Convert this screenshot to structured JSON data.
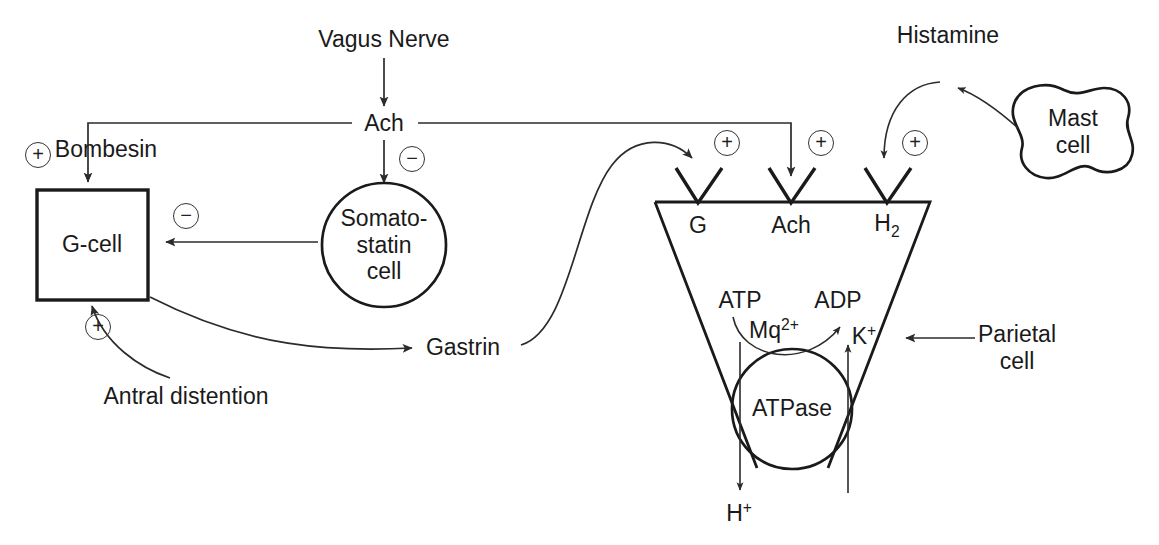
{
  "diagram": {
    "stroke_color": "#2b2b2b",
    "text_color": "#1a1a1a",
    "background": "#ffffff"
  },
  "nodes": {
    "vagus_nerve": {
      "label": "Vagus Nerve",
      "x": 384,
      "y": 40
    },
    "ach_source": {
      "label": "Ach",
      "x": 384,
      "y": 124
    },
    "bombesin": {
      "label": "Bombesin",
      "x": 106,
      "y": 150
    },
    "g_cell": {
      "label": "G-cell",
      "x": 92,
      "y": 245
    },
    "somatostatin_cell": {
      "label": "Somato-\nstatin\ncell",
      "line1": "Somato-",
      "line2": "statin",
      "line3": "cell",
      "x": 384,
      "y": 245
    },
    "antral_distention": {
      "label": "Antral distention",
      "x": 186,
      "y": 397
    },
    "gastrin": {
      "label": "Gastrin",
      "x": 463,
      "y": 348
    },
    "histamine": {
      "label": "Histamine",
      "x": 948,
      "y": 36
    },
    "mast_cell": {
      "line1": "Mast",
      "line2": "cell",
      "x": 1073,
      "y": 132
    },
    "parietal_cell": {
      "line1": "Parietal",
      "line2": "cell",
      "x": 1017,
      "y": 348
    },
    "atpase": {
      "label": "ATPase",
      "x": 792,
      "y": 409
    }
  },
  "receptors": [
    {
      "name": "gastrin-receptor",
      "label": "G",
      "x": 698,
      "y": 226
    },
    {
      "name": "ach-receptor",
      "label": "Ach",
      "x": 791,
      "y": 226
    },
    {
      "name": "histamine-receptor",
      "label": "H",
      "sub": "2",
      "x": 887,
      "y": 226
    }
  ],
  "signs": [
    {
      "name": "plus-bombesin",
      "symbol": "+",
      "x": 38,
      "y": 155
    },
    {
      "name": "minus-somatostatin",
      "symbol": "−",
      "x": 186,
      "y": 216
    },
    {
      "name": "minus-ach-somatostatin",
      "symbol": "−",
      "x": 412,
      "y": 159
    },
    {
      "name": "plus-antral-distention",
      "symbol": "+",
      "x": 98,
      "y": 327
    },
    {
      "name": "plus-gastrin-receptor",
      "symbol": "+",
      "x": 727,
      "y": 143
    },
    {
      "name": "plus-ach-receptor",
      "symbol": "+",
      "x": 821,
      "y": 143
    },
    {
      "name": "plus-histamine-receptor",
      "symbol": "+",
      "x": 915,
      "y": 143
    }
  ],
  "pump_labels": {
    "atp": {
      "label": "ATP",
      "x": 740,
      "y": 301
    },
    "adp": {
      "label": "ADP",
      "x": 838,
      "y": 301
    },
    "magnesium": {
      "label": "Mq",
      "sup": "2+",
      "x": 774,
      "y": 330
    },
    "potassium": {
      "label": "K",
      "sup": "+",
      "x": 864,
      "y": 336
    },
    "proton": {
      "label": "H",
      "sup": "+",
      "x": 739,
      "y": 513
    }
  },
  "connections": [
    {
      "name": "vagus-to-ach",
      "from": "vagus_nerve",
      "to": "ach_source",
      "type": "arrow"
    },
    {
      "name": "ach-to-bombesin-gcell",
      "from": "ach_source",
      "to": "g_cell",
      "type": "arrow"
    },
    {
      "name": "ach-to-ach-receptor",
      "from": "ach_source",
      "to": "ach-receptor",
      "type": "arrow"
    },
    {
      "name": "ach-to-somatostatin",
      "from": "ach_source",
      "to": "somatostatin_cell",
      "type": "inhibit"
    },
    {
      "name": "somatostatin-to-gcell",
      "from": "somatostatin_cell",
      "to": "g_cell",
      "type": "inhibit"
    },
    {
      "name": "antral-distention-to-gcell",
      "from": "antral_distention",
      "to": "g_cell",
      "type": "arrow"
    },
    {
      "name": "gcell-to-gastrin",
      "from": "g_cell",
      "to": "gastrin",
      "type": "arrow"
    },
    {
      "name": "gastrin-to-g-receptor",
      "from": "gastrin",
      "to": "gastrin-receptor",
      "type": "arrow"
    },
    {
      "name": "mast-cell-to-histamine",
      "from": "mast_cell",
      "to": "histamine",
      "type": "arrow"
    },
    {
      "name": "histamine-to-h2-receptor",
      "from": "histamine",
      "to": "histamine-receptor",
      "type": "arrow"
    },
    {
      "name": "parietal-cell-pointer",
      "from": "parietal_cell",
      "to": "parietal-cell-body",
      "type": "pointer"
    },
    {
      "name": "atp-to-adp",
      "from": "atp",
      "to": "adp",
      "type": "curved-arrow"
    },
    {
      "name": "proton-efflux",
      "from": "atpase",
      "to": "proton",
      "type": "arrow"
    },
    {
      "name": "potassium-influx",
      "from": "potassium",
      "to": "atpase",
      "type": "arrow"
    }
  ]
}
